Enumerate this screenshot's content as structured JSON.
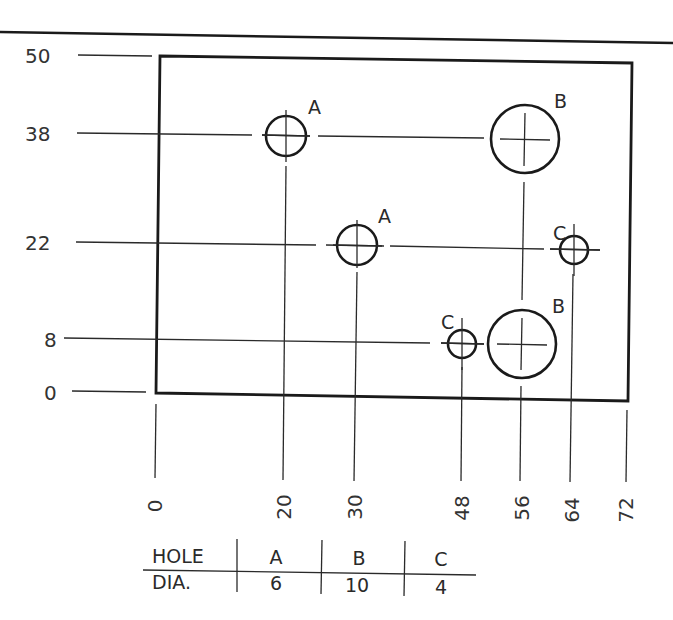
{
  "drawing": {
    "title": "Hole location drawing (rectangular plate, coordinate dimensioning)",
    "colors": {
      "line": "#1a1a1a",
      "thin": "#2a2a2a",
      "text": "#333333",
      "background": "#ffffff"
    },
    "plate": {
      "width": 72,
      "height": 50
    },
    "y_dimensions": [
      {
        "value": "50",
        "y": 56
      },
      {
        "value": "38",
        "y": 134
      },
      {
        "value": "22",
        "y": 243
      },
      {
        "value": "8",
        "y": 340
      },
      {
        "value": "0",
        "y": 393
      }
    ],
    "x_dimensions": [
      {
        "value": "0",
        "x": 156
      },
      {
        "value": "20",
        "x": 284
      },
      {
        "value": "30",
        "x": 355
      },
      {
        "value": "48",
        "x": 462
      },
      {
        "value": "56",
        "x": 521
      },
      {
        "value": "64",
        "x": 571
      },
      {
        "value": "72",
        "x": 627
      }
    ],
    "holes": [
      {
        "label": "A",
        "x": 20,
        "y": 38,
        "dia": 6
      },
      {
        "label": "B",
        "x": 56,
        "y": 38,
        "dia": 10
      },
      {
        "label": "A",
        "x": 30,
        "y": 22,
        "dia": 6
      },
      {
        "label": "C",
        "x": 64,
        "y": 22,
        "dia": 4
      },
      {
        "label": "C",
        "x": 48,
        "y": 8,
        "dia": 4
      },
      {
        "label": "B",
        "x": 56,
        "y": 8,
        "dia": 10
      }
    ]
  },
  "hole_table": {
    "header_label": "HOLE",
    "row_label": "DIA.",
    "columns": [
      {
        "hole": "A",
        "dia": "6"
      },
      {
        "hole": "B",
        "dia": "10"
      },
      {
        "hole": "C",
        "dia": "4"
      }
    ]
  }
}
